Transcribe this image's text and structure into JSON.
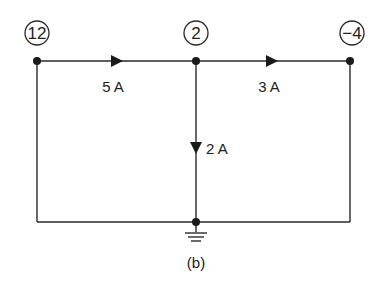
{
  "diagram": {
    "type": "circuit",
    "caption": "(b)",
    "colors": {
      "line": "#2a2a2a",
      "background": "#ffffff"
    },
    "nodes": [
      {
        "id": "left",
        "voltage": "12",
        "x": 37,
        "y": 61
      },
      {
        "id": "middle",
        "voltage": "2",
        "x": 196,
        "y": 61
      },
      {
        "id": "right",
        "voltage": "−4",
        "x": 350,
        "y": 61
      },
      {
        "id": "ground",
        "voltage": "",
        "x": 196,
        "y": 222
      }
    ],
    "branches": [
      {
        "from": "left",
        "to": "middle",
        "current": "5 A",
        "direction": "right"
      },
      {
        "from": "middle",
        "to": "right",
        "current": "3 A",
        "direction": "right"
      },
      {
        "from": "middle",
        "to": "ground",
        "current": "2 A",
        "direction": "down"
      }
    ],
    "ground_symbol": "ground-icon"
  }
}
